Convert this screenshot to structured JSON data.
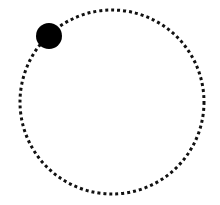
{
  "canvas": {
    "width": 220,
    "height": 205,
    "background": "#ffffff"
  },
  "orbit": {
    "cx": 112,
    "cy": 102,
    "r": 92,
    "stroke": "#111111",
    "stroke_width": 3,
    "dash": "3 3"
  },
  "marker": {
    "cx": 49,
    "cy": 36,
    "r": 13,
    "fill": "#000000"
  }
}
